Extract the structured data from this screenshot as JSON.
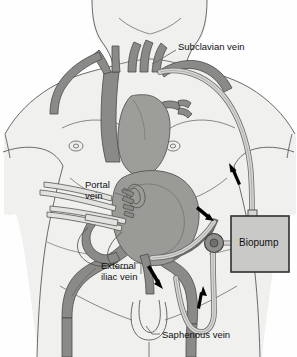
{
  "figure": {
    "background_color": "#fefefe"
  },
  "labels": {
    "subclavian": "Subclavian vein",
    "portal_line1": "Portal",
    "portal_line2": "vein",
    "external_line1": "External",
    "external_line2": "iliac vein",
    "saphenous": "Saphenous vein",
    "biopump": "Biopump"
  },
  "colors": {
    "body_fill": "#f0f0ef",
    "body_outline": "#5a5a58",
    "vessel_fill": "#8a8a88",
    "vessel_outline": "#4a4a48",
    "organ_fill": "#9a9a97",
    "organ_outline": "#56564f",
    "heart_fill": "#9d9d9a",
    "tube_fill": "#d6d6d4",
    "tube_outline": "#6a6a68",
    "pump_box_fill": "#c9c9c7",
    "pump_box_outline": "#333333",
    "pump_head_fill": "#8e8e8c",
    "arrow_color": "#000000",
    "text_color": "#111111",
    "leader_color": "#6a6a68"
  },
  "components": {
    "biopump_box": "centrifugal pump console",
    "pump_head": "pump head rotor",
    "inflow_tube": "saphenous vein cannula tubing",
    "outflow_tube": "subclavian vein return tubing",
    "arrows": [
      {
        "name": "arrow-saphenous-up",
        "direction": "up"
      },
      {
        "name": "arrow-portal-down",
        "direction": "down-right"
      },
      {
        "name": "arrow-subclavian-up",
        "direction": "up"
      },
      {
        "name": "arrow-iliac-down",
        "direction": "down"
      }
    ]
  }
}
